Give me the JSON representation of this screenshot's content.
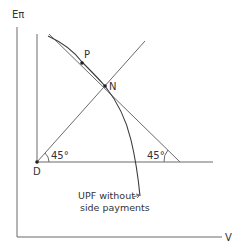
{
  "diagram": {
    "axes": {
      "y_label": "Eπ",
      "x_label": "V"
    },
    "points": {
      "origin": "D",
      "p": "P",
      "n": "N"
    },
    "angles": {
      "left": "45°",
      "right": "45°"
    },
    "annotation": {
      "line1": "UPF without",
      "line2": "side payments"
    },
    "colors": {
      "line": "#6a6a6a",
      "curve": "#3a3a3a",
      "text": "#333333"
    }
  }
}
